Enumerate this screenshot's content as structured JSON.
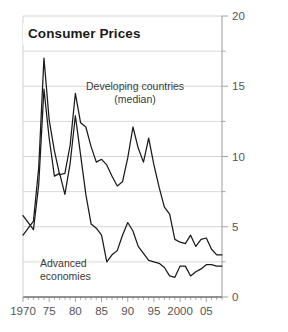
{
  "chart_data": {
    "type": "line",
    "title": "Consumer Prices",
    "xlabel": "",
    "ylabel": "",
    "xlim": [
      1970,
      2008
    ],
    "ylim": [
      0,
      20
    ],
    "yticks": [
      0,
      5,
      10,
      15,
      20
    ],
    "ytick_labels": [
      "0",
      "5",
      "10",
      "15",
      "20"
    ],
    "yminor_step": 2.5,
    "xticks": [
      1970,
      1975,
      1980,
      1985,
      1990,
      1995,
      2000,
      2005
    ],
    "xtick_labels": [
      "1970",
      "75",
      "80",
      "85",
      "90",
      "95",
      "2000",
      "05"
    ],
    "xminor_step": 1,
    "grid": "horizontal",
    "legend": "annotations",
    "y_axis_position": "right",
    "line_color": "#1a1a1a",
    "grid_color": "#cfcfcf",
    "annotations": [
      {
        "name": "developing-label",
        "line1": "Developing countries",
        "line2": "(median)"
      },
      {
        "name": "advanced-label",
        "line1": "Advanced",
        "line2": "economies"
      }
    ],
    "series": [
      {
        "name": "Developing countries (median)",
        "x": [
          1970,
          1971,
          1972,
          1973,
          1974,
          1975,
          1976,
          1977,
          1978,
          1979,
          1980,
          1981,
          1982,
          1983,
          1984,
          1985,
          1986,
          1987,
          1988,
          1989,
          1990,
          1991,
          1992,
          1993,
          1994,
          1995,
          1996,
          1997,
          1998,
          1999,
          2000,
          2001,
          2002,
          2003,
          2004,
          2005,
          2006,
          2007,
          2008
        ],
        "y": [
          4.4,
          4.9,
          5.4,
          9.2,
          17.0,
          12.6,
          10.4,
          8.7,
          8.8,
          10.8,
          14.5,
          12.4,
          12.1,
          10.7,
          9.6,
          9.8,
          9.4,
          8.6,
          7.9,
          8.2,
          9.9,
          12.1,
          10.6,
          9.6,
          11.3,
          9.4,
          7.8,
          6.4,
          5.9,
          4.1,
          3.9,
          3.8,
          4.4,
          3.6,
          4.1,
          4.2,
          3.4,
          3.0,
          3.0
        ]
      },
      {
        "name": "Advanced economies",
        "x": [
          1970,
          1971,
          1972,
          1973,
          1974,
          1975,
          1976,
          1977,
          1978,
          1979,
          1980,
          1981,
          1982,
          1983,
          1984,
          1985,
          1986,
          1987,
          1988,
          1989,
          1990,
          1991,
          1992,
          1993,
          1994,
          1995,
          1996,
          1997,
          1998,
          1999,
          2000,
          2001,
          2002,
          2003,
          2004,
          2005,
          2006,
          2007,
          2008
        ],
        "y": [
          5.8,
          5.3,
          4.8,
          8.0,
          14.8,
          11.3,
          8.6,
          8.8,
          7.3,
          9.5,
          12.9,
          10.1,
          7.3,
          5.2,
          4.9,
          4.4,
          2.5,
          3.0,
          3.3,
          4.4,
          5.3,
          4.7,
          3.6,
          3.1,
          2.6,
          2.5,
          2.4,
          2.1,
          1.5,
          1.4,
          2.2,
          2.2,
          1.5,
          1.8,
          2.0,
          2.3,
          2.3,
          2.2,
          2.2
        ]
      }
    ]
  }
}
